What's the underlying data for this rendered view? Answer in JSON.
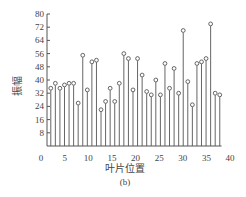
{
  "figure": {
    "caption": "(b)"
  },
  "chart_data": {
    "type": "stem",
    "title": "",
    "xlabel": "叶片位置",
    "ylabel": "振幅",
    "xlim": [
      0,
      40
    ],
    "ylim": [
      0,
      80
    ],
    "xticks": [
      0,
      5,
      10,
      15,
      20,
      25,
      30,
      35,
      40
    ],
    "yticks": [
      8,
      16,
      24,
      32,
      40,
      48,
      56,
      64,
      72,
      80
    ],
    "grid": false,
    "legend": null,
    "x": [
      1,
      2,
      3,
      4,
      5,
      6,
      7,
      8,
      9,
      10,
      11,
      12,
      13,
      14,
      15,
      16,
      17,
      18,
      19,
      20,
      21,
      22,
      23,
      24,
      25,
      26,
      27,
      28,
      29,
      30,
      31,
      32,
      33,
      34,
      35,
      36,
      37,
      38
    ],
    "values": [
      35,
      38,
      35,
      37,
      38,
      38,
      26,
      55,
      34,
      51,
      52,
      22,
      27,
      35,
      27,
      38,
      56,
      53,
      34,
      53,
      43,
      33,
      31,
      40,
      31,
      50,
      35,
      47,
      32,
      70,
      39,
      25,
      50,
      51,
      53,
      74,
      32,
      31
    ],
    "marker": "open-circle",
    "color": "#555555"
  }
}
